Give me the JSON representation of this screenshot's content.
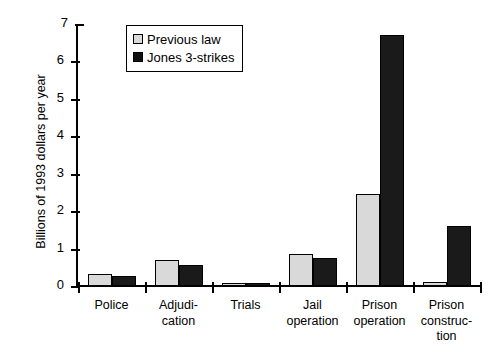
{
  "chart_data": {
    "type": "bar",
    "title": "",
    "xlabel": "",
    "ylabel": "Billions of 1993 dollars per year",
    "ylim": [
      0,
      7
    ],
    "yticks": [
      0,
      1,
      2,
      3,
      4,
      5,
      6,
      7
    ],
    "ytick_labels": [
      "0",
      "1",
      "2",
      "3",
      "4",
      "5",
      "6",
      "7"
    ],
    "grid": false,
    "legend_position": "top-left-inside",
    "categories": [
      "Police",
      "Adjudi-\ncation",
      "Trials",
      "Jail\noperation",
      "Prison\noperation",
      "Prison\nconstruc-\ntion"
    ],
    "category_lines": [
      [
        "Police"
      ],
      [
        "Adjudi-",
        "cation"
      ],
      [
        "Trials"
      ],
      [
        "Jail",
        "operation"
      ],
      [
        "Prison",
        "operation"
      ],
      [
        "Prison",
        "construc-",
        "tion"
      ]
    ],
    "series": [
      {
        "name": "Previous law",
        "color": "#d9d9d9",
        "values": [
          0.33,
          0.7,
          0.06,
          0.86,
          2.45,
          0.1
        ]
      },
      {
        "name": "Jones 3-strikes",
        "color": "#1a1a1a",
        "values": [
          0.27,
          0.56,
          0.06,
          0.75,
          6.7,
          1.6
        ]
      }
    ]
  },
  "legend": {
    "items": [
      {
        "label": "Previous law",
        "swatch": "light-gray-square"
      },
      {
        "label": "Jones 3-strikes",
        "swatch": "black-square"
      }
    ]
  }
}
